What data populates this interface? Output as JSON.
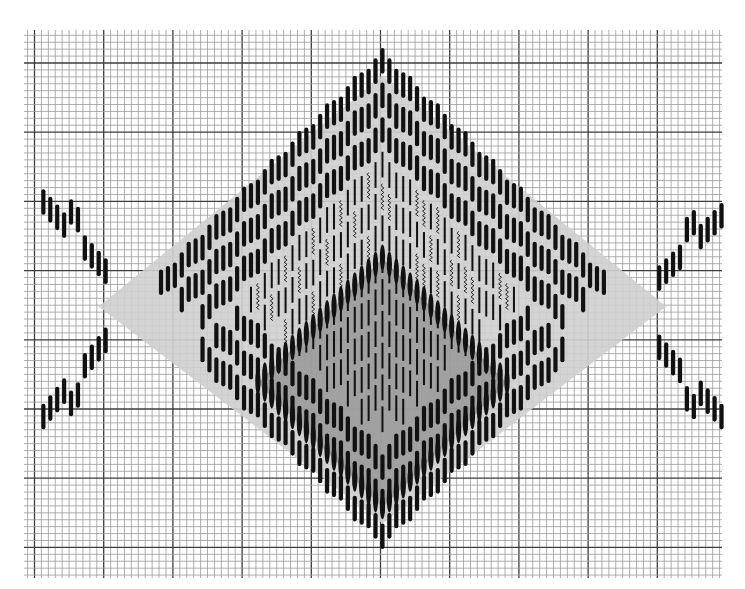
{
  "diagram": {
    "canvas": {
      "width": 745,
      "height": 589,
      "background": "#ffffff"
    },
    "grid": {
      "x0": 24,
      "y0": 30,
      "x1": 722,
      "y1": 578,
      "cell": 6.92,
      "major_every": 10,
      "major_origin_x": 34.5,
      "major_origin_y": 63,
      "minor_color": "#9a9a9a",
      "major_color": "#3c3c3c",
      "minor_width": 0.8,
      "major_width": 1.3
    },
    "pattern": {
      "center_col": 50,
      "col_origin_x": 33,
      "stitch_len_cells": 4,
      "stitch_color": "#111111",
      "fill_gray": "#8c8c8c",
      "highlight_white": "#ffffff",
      "diamond": {
        "half_width_cols": 41,
        "top_row": 2.6,
        "bottom_row": 75.3,
        "outline_bands": 3,
        "band_gap_rows": 5
      },
      "inner_diamond": {
        "half_width_cols": 18,
        "top_row": 33,
        "style": "lens"
      },
      "wings": {
        "left_top_start": [
          1,
          23
        ],
        "left_top_end": [
          10,
          33
        ],
        "left_bottom_start": [
          1,
          54
        ],
        "left_bottom_end": [
          10,
          43
        ],
        "right_top_start": [
          99,
          25
        ],
        "right_top_end": [
          90,
          34
        ],
        "right_bottom_start": [
          99,
          54
        ],
        "right_bottom_end": [
          90,
          44
        ]
      }
    }
  }
}
